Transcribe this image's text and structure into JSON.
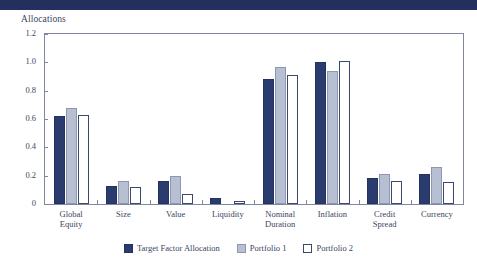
{
  "banner": {
    "color": "#232f5c"
  },
  "chart_data": {
    "type": "bar",
    "title": "Allocations",
    "xlabel": "",
    "ylabel": "",
    "ylim": [
      0,
      1.2
    ],
    "yticks": [
      "0",
      "0.2",
      "0.4",
      "0.6",
      "0.8",
      "1.0",
      "1.2"
    ],
    "ytick_values": [
      0,
      0.2,
      0.4,
      0.6,
      0.8,
      1.0,
      1.2
    ],
    "grid": false,
    "legend_position": "bottom",
    "categories": [
      "Global Equity",
      "Size",
      "Value",
      "Liquidity",
      "Nominal Duration",
      "Inflation",
      "Credit Spread",
      "Currency"
    ],
    "category_lines": [
      [
        "Global",
        "Equity"
      ],
      [
        "Size"
      ],
      [
        "Value"
      ],
      [
        "Liquidity"
      ],
      [
        "Nominal",
        "Duration"
      ],
      [
        "Inflation"
      ],
      [
        "Credit",
        "Spread"
      ],
      [
        "Currency"
      ]
    ],
    "series": [
      {
        "name": "Target Factor Allocation",
        "color": "#2a3c6e",
        "values": [
          0.62,
          0.13,
          0.165,
          0.04,
          0.88,
          1.0,
          0.185,
          0.215
        ]
      },
      {
        "name": "Portfolio 1",
        "color": "#b7bfd2",
        "values": [
          0.68,
          0.16,
          0.2,
          0.0,
          0.97,
          0.94,
          0.215,
          0.26
        ]
      },
      {
        "name": "Portfolio 2",
        "color": "#ffffff",
        "values": [
          0.63,
          0.12,
          0.07,
          0.02,
          0.91,
          1.01,
          0.165,
          0.155
        ]
      }
    ]
  }
}
